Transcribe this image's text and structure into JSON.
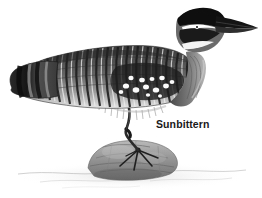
{
  "image": {
    "type": "engraving-illustration",
    "subject": "Sunbittern",
    "background_color": "#ffffff",
    "medium": "black-and-white halftone engraving"
  },
  "label": {
    "text": "Sunbittern",
    "color": "#1a1a1a",
    "position": {
      "x": 156,
      "y": 118
    }
  },
  "palette": {
    "background": "#ffffff",
    "ink_black": "#111111",
    "dark_grey": "#3d3d3d",
    "mid_grey": "#7a7a7a",
    "light_grey": "#b5b5b5",
    "pale_grey": "#d8d8d8",
    "rock_grey": "#9a9a9a",
    "highlight_white": "#fdfdfd"
  },
  "subject_parts": [
    {
      "name": "bill",
      "description": "long straight pointed dark bill angled up-right",
      "color": "#1b1b1b"
    },
    {
      "name": "crown",
      "description": "black cap over top of head",
      "color": "#121212"
    },
    {
      "name": "eye-stripe",
      "description": "white stripe through the eye",
      "color": "#ffffff"
    },
    {
      "name": "throat-stripe",
      "description": "white band below the dark cheek",
      "color": "#fafafa"
    },
    {
      "name": "neck",
      "description": "long curved S-shaped grey neck",
      "color": "#6e6e6e"
    },
    {
      "name": "breast",
      "description": "soft grey shaded breast",
      "color": "#8a8a8a"
    },
    {
      "name": "back",
      "description": "barred plumage with vertical dark bars",
      "color": "#4a4a4a"
    },
    {
      "name": "wing-patch",
      "description": "dark panel scattered with white spots",
      "color": "#222222"
    },
    {
      "name": "tail",
      "description": "tapering tail with broad dark band near tip",
      "color": "#1c1c1c"
    },
    {
      "name": "leg",
      "description": "single slender dark leg with knee joint",
      "color": "#2a2a2a"
    },
    {
      "name": "foot",
      "description": "splayed toes gripping the rock",
      "color": "#222222"
    },
    {
      "name": "rock",
      "description": "rounded grey rock perch",
      "color": "#9a9a9a"
    },
    {
      "name": "ground-wash",
      "description": "faint grey water or ground wash below rock",
      "color": "#cfcfcf"
    }
  ]
}
